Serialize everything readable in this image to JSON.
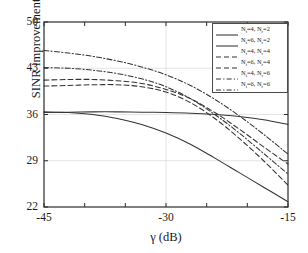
{
  "chart_data": {
    "type": "line",
    "title": "",
    "xlabel": "γ (dB)",
    "ylabel": "SINR improvement (dB)",
    "xlim": [
      -45,
      -15
    ],
    "ylim": [
      22,
      50
    ],
    "xticks": [
      -45,
      -30,
      -15
    ],
    "xticklabels": [
      "-45",
      "-30",
      "-15"
    ],
    "yticks": [
      22,
      29,
      36,
      43,
      50
    ],
    "yticklabels": [
      "22",
      "29",
      "36",
      "43",
      "50"
    ],
    "grid": true,
    "legend_position": "upper right",
    "x": [
      -45,
      -42,
      -39,
      -36,
      -33,
      -30,
      -27,
      -24,
      -21,
      -18,
      -15
    ],
    "series": [
      {
        "name": "Nt4Nr2",
        "label_plain": "N_t=4, N_r=2",
        "label_pre": "N",
        "label_sub1": "t",
        "label_mid": "=4, N",
        "label_sub2": "r",
        "label_post": "=2",
        "style": "solid",
        "color": "#333333",
        "values": [
          36.3,
          36.35,
          36.4,
          36.4,
          36.35,
          36.3,
          36.2,
          36.0,
          35.7,
          35.2,
          34.5
        ]
      },
      {
        "name": "Nt6Nr2",
        "label_plain": "N_t=6, N_r=2",
        "label_pre": "N",
        "label_sub1": "t",
        "label_mid": "=6, N",
        "label_sub2": "r",
        "label_post": "=2",
        "style": "solid",
        "color": "#333333",
        "values": [
          36.4,
          36.3,
          36.0,
          35.4,
          34.5,
          33.2,
          31.5,
          29.4,
          27.2,
          25.0,
          22.8
        ]
      },
      {
        "name": "Nt4Nr4",
        "label_plain": "N_t=4, N_r=4",
        "label_pre": "N",
        "label_sub1": "t",
        "label_mid": "=4, N",
        "label_sub2": "r",
        "label_post": "=4",
        "style": "dashed",
        "color": "#333333",
        "values": [
          40.3,
          40.4,
          40.5,
          40.5,
          40.2,
          39.4,
          37.8,
          35.4,
          32.4,
          29.0,
          25.3
        ]
      },
      {
        "name": "Nt6Nr4",
        "label_plain": "N_t=6, N_r=4",
        "label_pre": "N",
        "label_sub1": "t",
        "label_mid": "=6, N",
        "label_sub2": "r",
        "label_post": "=4",
        "style": "dashed",
        "color": "#333333",
        "values": [
          41.2,
          41.3,
          41.3,
          41.1,
          40.7,
          39.8,
          38.4,
          36.3,
          33.8,
          31.1,
          28.5
        ]
      },
      {
        "name": "Nt4Nr6",
        "label_plain": "N_t=4, N_r=6",
        "label_pre": "N",
        "label_sub1": "t",
        "label_mid": "=4, N",
        "label_sub2": "r",
        "label_post": "=6",
        "style": "dashdot",
        "color": "#333333",
        "values": [
          43.1,
          43.0,
          42.7,
          42.2,
          41.4,
          40.2,
          38.4,
          36.0,
          33.2,
          30.1,
          27.0
        ]
      },
      {
        "name": "Nt6Nr6",
        "label_plain": "N_t=6, N_r=6",
        "label_pre": "N",
        "label_sub1": "t",
        "label_mid": "=6, N",
        "label_sub2": "r",
        "label_post": "=6",
        "style": "dashdot",
        "color": "#333333",
        "values": [
          45.7,
          45.3,
          44.8,
          44.1,
          43.2,
          42.0,
          40.4,
          38.3,
          35.8,
          33.0,
          30.0
        ]
      }
    ]
  }
}
